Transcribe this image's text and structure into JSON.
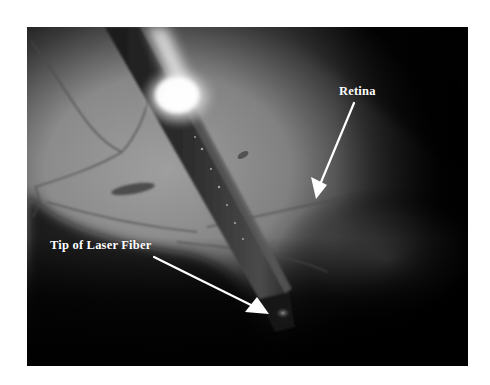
{
  "figure": {
    "labels": {
      "retina": "Retina",
      "fiber_tip": "Tip of Laser Fiber"
    },
    "annotations": [
      {
        "label": "Retina",
        "arrow_from": [
          354,
          103
        ],
        "arrow_to": [
          316,
          198
        ]
      },
      {
        "label": "Tip of Laser Fiber",
        "arrow_from": [
          154,
          257
        ],
        "arrow_to": [
          268,
          314
        ]
      }
    ],
    "colors": {
      "border": "#ffffff",
      "background": "#000000",
      "annotation": "#ffffff"
    }
  }
}
